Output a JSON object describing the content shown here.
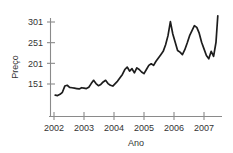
{
  "chart_data": {
    "type": "line",
    "title": "",
    "xlabel": "Ano",
    "ylabel": "Preço",
    "xlim": [
      2002.0,
      2007.5
    ],
    "ylim": [
      118,
      322
    ],
    "grid": false,
    "legend": null,
    "xticks": [
      "2002",
      "2003",
      "2004",
      "2005",
      "2006",
      "2007"
    ],
    "xtick_values": [
      2002,
      2003,
      2004,
      2005,
      2006,
      2007
    ],
    "yticks": [
      "151",
      "201",
      "251",
      "301"
    ],
    "ytick_values": [
      151,
      201,
      251,
      301
    ],
    "series": [
      {
        "name": "Preço",
        "x": [
          2002.04,
          2002.12,
          2002.2,
          2002.28,
          2002.36,
          2002.44,
          2002.52,
          2002.6,
          2002.68,
          2002.76,
          2002.84,
          2002.92,
          2003.0,
          2003.08,
          2003.16,
          2003.24,
          2003.32,
          2003.4,
          2003.48,
          2003.56,
          2003.64,
          2003.72,
          2003.8,
          2003.88,
          2003.96,
          2004.04,
          2004.12,
          2004.2,
          2004.28,
          2004.36,
          2004.44,
          2004.52,
          2004.6,
          2004.68,
          2004.76,
          2004.84,
          2004.92,
          2005.0,
          2005.08,
          2005.16,
          2005.24,
          2005.32,
          2005.4,
          2005.48,
          2005.56,
          2005.64,
          2005.72,
          2005.8,
          2005.88,
          2005.96,
          2006.04,
          2006.12,
          2006.2,
          2006.28,
          2006.36,
          2006.44,
          2006.52,
          2006.6,
          2006.68,
          2006.76,
          2006.84,
          2006.92,
          2007.0,
          2007.08,
          2007.16,
          2007.24,
          2007.32,
          2007.4,
          2007.46
        ],
        "y": [
          124,
          123,
          126,
          131,
          146,
          148,
          143,
          142,
          141,
          140,
          139,
          142,
          141,
          140,
          143,
          152,
          160,
          152,
          147,
          150,
          156,
          160,
          152,
          148,
          146,
          152,
          158,
          166,
          174,
          186,
          192,
          182,
          188,
          178,
          190,
          186,
          180,
          176,
          186,
          196,
          200,
          196,
          206,
          214,
          222,
          230,
          246,
          268,
          302,
          272,
          252,
          232,
          228,
          222,
          234,
          250,
          268,
          280,
          292,
          288,
          274,
          252,
          236,
          220,
          212,
          230,
          218,
          252,
          316
        ]
      }
    ]
  },
  "axis": {
    "ylabel_display": "Preço",
    "xlabel_display": "Ano"
  }
}
